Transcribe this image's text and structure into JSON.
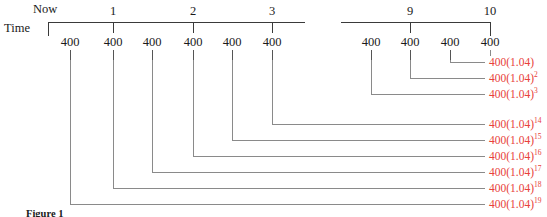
{
  "figure": {
    "caption": "Figure 1",
    "axis_label": "Time",
    "now_label": "Now",
    "accent_color": "#e8413a",
    "line_color": "#3a3a3a"
  },
  "axis": {
    "tick_labels": [
      "1",
      "2",
      "3",
      "9",
      "10"
    ],
    "ticks": [
      {
        "label": "1",
        "x": 113
      },
      {
        "label": "2",
        "x": 193
      },
      {
        "label": "3",
        "x": 272
      },
      {
        "label": "9",
        "x": 410
      },
      {
        "label": "10",
        "x": 490
      }
    ],
    "segments": [
      {
        "x1": 48,
        "x2": 305
      },
      {
        "x1": 341,
        "x2": 490
      }
    ],
    "y": 22,
    "endcap_left_x": 48,
    "endcap_right_x": 490
  },
  "payments": [
    {
      "index": 1,
      "amount": "400",
      "x": 70,
      "value_base": "400(1.04)",
      "exponent": "19"
    },
    {
      "index": 2,
      "amount": "400",
      "x": 113,
      "value_base": "400(1.04)",
      "exponent": "18"
    },
    {
      "index": 3,
      "amount": "400",
      "x": 152,
      "value_base": "400(1.04)",
      "exponent": "17"
    },
    {
      "index": 4,
      "amount": "400",
      "x": 193,
      "value_base": "400(1.04)",
      "exponent": "16"
    },
    {
      "index": 5,
      "amount": "400",
      "x": 232,
      "value_base": "400(1.04)",
      "exponent": "15"
    },
    {
      "index": 6,
      "amount": "400",
      "x": 272,
      "value_base": "400(1.04)",
      "exponent": "14"
    },
    {
      "index": 7,
      "amount": "400",
      "x": 371,
      "value_base": "400(1.04)",
      "exponent": "3"
    },
    {
      "index": 8,
      "amount": "400",
      "x": 410,
      "value_base": "400(1.04)",
      "exponent": "2"
    },
    {
      "index": 9,
      "amount": "400",
      "x": 450,
      "value_base": "400(1.04)",
      "exponent": ""
    },
    {
      "index": 10,
      "amount": "400",
      "x": 490,
      "value_base": "400",
      "exponent": ""
    }
  ],
  "accumulated_values": [
    {
      "base": "400(1.04)",
      "exponent": "",
      "x": 489,
      "y": 62,
      "elbow_x": 450,
      "stub_x1": 464,
      "stub_x2": 485
    },
    {
      "base": "400(1.04)",
      "exponent": "2",
      "x": 489,
      "y": 78,
      "elbow_x": 410,
      "stub_x1": 464,
      "stub_x2": 485
    },
    {
      "base": "400(1.04)",
      "exponent": "3",
      "x": 489,
      "y": 94,
      "elbow_x": 371,
      "stub_x1": 464,
      "stub_x2": 485
    },
    {
      "base": "400(1.04)",
      "exponent": "14",
      "x": 489,
      "y": 124,
      "elbow_x": 272,
      "stub_x1": 464,
      "stub_x2": 485
    },
    {
      "base": "400(1.04)",
      "exponent": "15",
      "x": 489,
      "y": 140,
      "elbow_x": 232,
      "stub_x1": 464,
      "stub_x2": 485
    },
    {
      "base": "400(1.04)",
      "exponent": "16",
      "x": 489,
      "y": 156,
      "elbow_x": 193,
      "stub_x1": 464,
      "stub_x2": 485
    },
    {
      "base": "400(1.04)",
      "exponent": "17",
      "x": 489,
      "y": 172,
      "elbow_x": 152,
      "stub_x1": 464,
      "stub_x2": 485
    },
    {
      "base": "400(1.04)",
      "exponent": "18",
      "x": 489,
      "y": 188,
      "elbow_x": 113,
      "stub_x1": 464,
      "stub_x2": 485
    },
    {
      "base": "400(1.04)",
      "exponent": "19",
      "x": 489,
      "y": 204,
      "elbow_x": 70,
      "stub_x1": 464,
      "stub_x2": 485
    }
  ]
}
